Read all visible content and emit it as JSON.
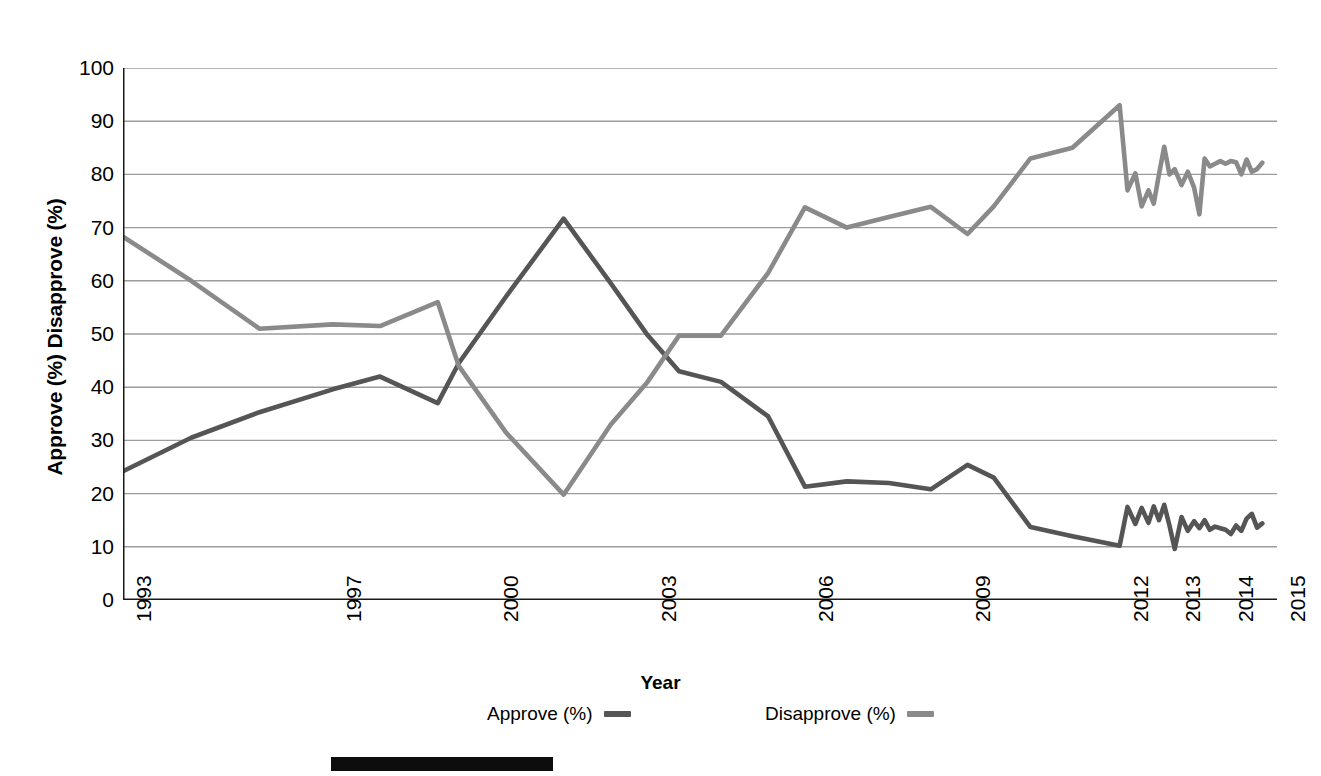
{
  "axes": {
    "y_title": "Approve (%) Disapprove (%)",
    "x_title": "Year",
    "y_ticks": [
      "0",
      "10",
      "20",
      "30",
      "40",
      "50",
      "60",
      "70",
      "80",
      "90",
      "100"
    ],
    "x_ticks": [
      "1993",
      "1997",
      "2000",
      "2003",
      "2006",
      "2009",
      "2012",
      "2013",
      "2014",
      "2015"
    ]
  },
  "legend": {
    "approve_label": "Approve (%)",
    "disapprove_label": "Disapprove (%)",
    "approve_color": "#555555",
    "disapprove_color": "#8a8a8a"
  },
  "chart_data": {
    "type": "line",
    "title": "",
    "subtitle": "",
    "xlabel": "Year",
    "ylabel": "Approve (%) Disapprove (%)",
    "xlim": [
      1993,
      2015
    ],
    "ylim": [
      0,
      100
    ],
    "y_ticks": [
      0,
      10,
      20,
      30,
      40,
      50,
      60,
      70,
      80,
      90,
      100
    ],
    "x_tick_labels": [
      1993,
      1997,
      2000,
      2003,
      2006,
      2009,
      2012,
      2013,
      2014,
      2015
    ],
    "grid": "horizontal",
    "legend_position": "bottom",
    "series": [
      {
        "name": "Approve (%)",
        "color": "#555555",
        "x": [
          1993.0,
          1994.3,
          1995.6,
          1997.0,
          1997.9,
          1999.0,
          1999.4,
          2000.3,
          2001.4,
          2002.3,
          2003.0,
          2003.6,
          2004.4,
          2005.3,
          2006.0,
          2006.8,
          2007.6,
          2008.4,
          2009.1,
          2009.6,
          2010.3,
          2011.1,
          2012.0,
          2012.15,
          2012.3,
          2012.42,
          2012.55,
          2012.65,
          2012.75,
          2012.85,
          2012.95,
          2013.05,
          2013.18,
          2013.3,
          2013.42,
          2013.52,
          2013.62,
          2013.72,
          2013.82,
          2013.92,
          2014.02,
          2014.12,
          2014.22,
          2014.32,
          2014.42,
          2014.52,
          2014.62,
          2014.72
        ],
        "y": [
          24.2,
          30.5,
          35.3,
          39.6,
          42.0,
          37.0,
          44.5,
          57.0,
          71.7,
          59.5,
          49.8,
          43.0,
          41.0,
          34.5,
          21.3,
          22.3,
          22.0,
          20.8,
          25.4,
          23.0,
          13.7,
          12.0,
          10.2,
          17.5,
          14.3,
          17.3,
          14.5,
          17.6,
          15.0,
          17.9,
          14.0,
          9.6,
          15.6,
          13.0,
          14.8,
          13.5,
          15.0,
          13.2,
          13.8,
          13.5,
          13.2,
          12.4,
          14.0,
          13.0,
          15.3,
          16.2,
          13.6,
          14.4
        ]
      },
      {
        "name": "Disapprove (%)",
        "color": "#8a8a8a",
        "x": [
          1993.0,
          1994.3,
          1995.6,
          1997.0,
          1997.9,
          1999.0,
          1999.4,
          2000.3,
          2001.4,
          2002.3,
          2003.0,
          2003.6,
          2004.4,
          2005.3,
          2006.0,
          2006.8,
          2007.6,
          2008.4,
          2009.1,
          2009.6,
          2010.3,
          2011.1,
          2012.0,
          2012.15,
          2012.3,
          2012.42,
          2012.55,
          2012.65,
          2012.75,
          2012.85,
          2012.95,
          2013.05,
          2013.18,
          2013.3,
          2013.42,
          2013.52,
          2013.62,
          2013.72,
          2013.82,
          2013.92,
          2014.02,
          2014.12,
          2014.22,
          2014.32,
          2014.42,
          2014.52,
          2014.62,
          2014.72
        ],
        "y": [
          68.3,
          60.0,
          51.0,
          51.8,
          51.5,
          56.0,
          44.0,
          31.5,
          19.8,
          33.0,
          41.0,
          49.7,
          49.7,
          61.5,
          73.8,
          70.0,
          72.0,
          73.9,
          68.8,
          74.0,
          83.0,
          85.0,
          93.0,
          77.0,
          80.2,
          74.0,
          77.0,
          74.5,
          80.0,
          85.2,
          80.0,
          81.0,
          78.0,
          80.5,
          77.5,
          72.5,
          83.0,
          81.5,
          82.0,
          82.5,
          82.0,
          82.5,
          82.3,
          80.0,
          82.8,
          80.5,
          81.0,
          82.2
        ]
      }
    ]
  }
}
